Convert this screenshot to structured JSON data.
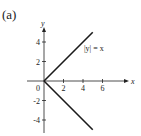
{
  "panel_label": "(a)",
  "chart_data": {
    "type": "line",
    "title": "",
    "xlabel": "x",
    "ylabel": "y",
    "xlim": [
      -1.5,
      7.5
    ],
    "ylim": [
      -5,
      5
    ],
    "x_ticks": [
      0,
      2,
      4,
      6
    ],
    "x_tick_labels": [
      "0",
      "2",
      "4",
      "6"
    ],
    "y_ticks": [
      -4,
      -2,
      2,
      4
    ],
    "y_tick_labels": [
      "-4",
      "-2",
      "2",
      "4"
    ],
    "grid": false,
    "legend": null,
    "annotations": [
      {
        "text": "|y| = x",
        "x": 4.3,
        "y": 3.4
      }
    ],
    "series": [
      {
        "name": "|y| = x (upper branch)",
        "x": [
          0,
          5
        ],
        "y": [
          0,
          5
        ]
      },
      {
        "name": "|y| = x (lower branch)",
        "x": [
          0,
          5
        ],
        "y": [
          0,
          -5
        ]
      }
    ],
    "color": "#1a1a1a"
  }
}
